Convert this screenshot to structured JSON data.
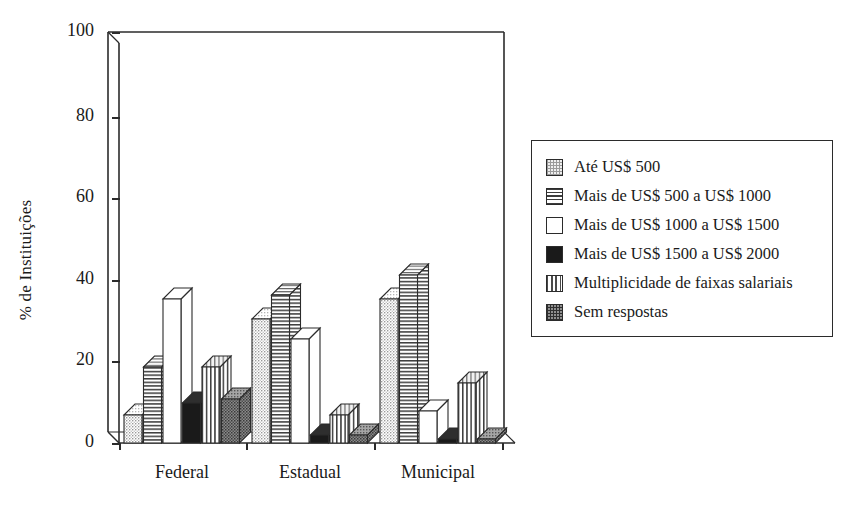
{
  "chart_data": {
    "type": "bar",
    "title": "",
    "subtitle": "",
    "xlabel": "",
    "ylabel": "% de Instituições",
    "categories": [
      "Federal",
      "Estadual",
      "Municipal"
    ],
    "ylim": [
      0,
      100
    ],
    "yticks": [
      0,
      20,
      40,
      60,
      80,
      100
    ],
    "ytick_labels": [
      "0",
      "20",
      "40",
      "60",
      "80",
      "100"
    ],
    "grid": false,
    "legend_position": "right",
    "style": "3d-grouped-columns",
    "series": [
      {
        "name": "Até US$ 500",
        "pattern": "light-stipple",
        "color": "#d9d9d9",
        "values": [
          7,
          31,
          36
        ]
      },
      {
        "name": "Mais de US$ 500 a US$ 1000",
        "pattern": "horizontal-lines",
        "color": "#e8e8e8",
        "values": [
          19,
          37,
          42
        ]
      },
      {
        "name": "Mais de US$ 1000 a US$ 1500",
        "pattern": "solid-white",
        "color": "#ffffff",
        "values": [
          36,
          26,
          8
        ]
      },
      {
        "name": "Mais de US$ 1500 a US$ 2000",
        "pattern": "solid-black",
        "color": "#1a1a1a",
        "values": [
          10,
          2,
          1
        ]
      },
      {
        "name": "Multiplicidade de faixas salariais",
        "pattern": "vertical-lines",
        "color": "#e4e4e4",
        "values": [
          19,
          7,
          15
        ]
      },
      {
        "name": "Sem respostas",
        "pattern": "dark-stipple",
        "color": "#8f8f8f",
        "values": [
          11,
          2,
          1
        ]
      }
    ]
  },
  "legend": {
    "items": [
      "Até US$ 500",
      "Mais de US$ 500 a US$ 1000",
      "Mais de US$ 1000 a US$ 1500",
      "Mais de US$ 1500 a US$ 2000",
      "Multiplicidade de faixas salariais",
      "Sem respostas"
    ]
  },
  "axes": {
    "y_title": "% de Instituições",
    "y_ticks": [
      "100",
      "80",
      "60",
      "40",
      "20",
      "0"
    ],
    "x_ticks": [
      "Federal",
      "Estadual",
      "Municipal"
    ]
  },
  "colors": {
    "ink": "#2b2b2b",
    "light_stipple": "#d9d9d9",
    "dark_stipple": "#8f8f8f",
    "black_fill": "#1a1a1a",
    "white_fill": "#ffffff"
  }
}
